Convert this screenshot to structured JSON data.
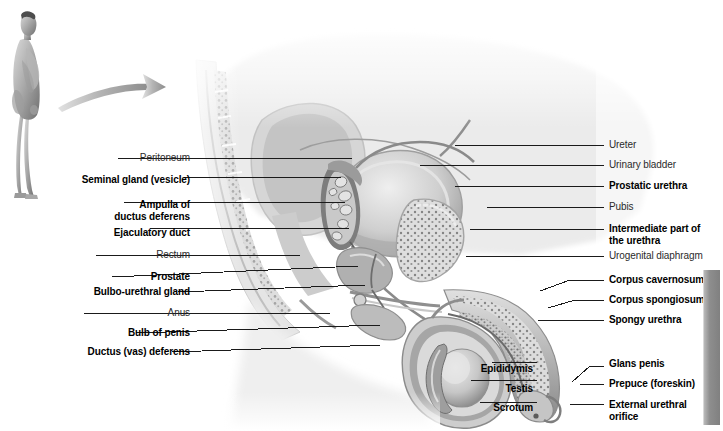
{
  "figure": {
    "orientation_figure_alt": "standing-male-body-profile",
    "arrow_alt": "curved-arrow-pointing-right",
    "background_color": "#ffffff",
    "line_color": "#1a1a1a",
    "bold_label_color": "#000000",
    "plain_label_color": "#2b2b2b",
    "accent_gray": "#808080"
  },
  "labels_left": [
    {
      "text": "Peritoneum",
      "bold": false,
      "x": 60,
      "y": 158,
      "anchor_x": 352,
      "anchor_y": 158
    },
    {
      "text": "Seminal gland (vesicle)",
      "bold": true,
      "x": 60,
      "y": 180,
      "anchor_x": 341,
      "anchor_y": 177
    },
    {
      "text": "Ampulla of\nductus deferens",
      "bold": true,
      "x": 60,
      "y": 210,
      "anchor_x": 345,
      "anchor_y": 202
    },
    {
      "text": "Ejaculatory duct",
      "bold": true,
      "x": 60,
      "y": 233,
      "anchor_x": 349,
      "anchor_y": 228
    },
    {
      "text": "Rectum",
      "bold": false,
      "x": 60,
      "y": 255,
      "anchor_x": 300,
      "anchor_y": 255
    },
    {
      "text": "Prostate",
      "bold": true,
      "x": 60,
      "y": 277,
      "anchor_x": 358,
      "anchor_y": 264
    },
    {
      "text": "Bulbo-urethral gland",
      "bold": true,
      "x": 60,
      "y": 292,
      "anchor_x": 365,
      "anchor_y": 285
    },
    {
      "text": "Anus",
      "bold": false,
      "x": 60,
      "y": 313,
      "anchor_x": 330,
      "anchor_y": 313
    },
    {
      "text": "Bulb of penis",
      "bold": true,
      "x": 60,
      "y": 333,
      "anchor_x": 380,
      "anchor_y": 325
    },
    {
      "text": "Ductus (vas) deferens",
      "bold": true,
      "x": 60,
      "y": 352,
      "anchor_x": 380,
      "anchor_y": 345
    }
  ],
  "labels_right": [
    {
      "text": "Ureter",
      "bold": false,
      "x": 609,
      "y": 145,
      "anchor_x": 455,
      "anchor_y": 145
    },
    {
      "text": "Urinary bladder",
      "bold": false,
      "x": 609,
      "y": 165,
      "anchor_x": 420,
      "anchor_y": 165
    },
    {
      "text": "Prostatic urethra",
      "bold": true,
      "x": 609,
      "y": 186,
      "anchor_x": 455,
      "anchor_y": 186
    },
    {
      "text": "Pubis",
      "bold": false,
      "x": 609,
      "y": 207,
      "anchor_x": 487,
      "anchor_y": 207
    },
    {
      "text": "Intermediate part of\nthe urethra",
      "bold": true,
      "x": 609,
      "y": 234,
      "anchor_x": 470,
      "anchor_y": 229
    },
    {
      "text": "Urogenital diaphragm",
      "bold": false,
      "x": 609,
      "y": 256,
      "anchor_x": 466,
      "anchor_y": 256
    },
    {
      "text": "Corpus cavernosum",
      "bold": true,
      "x": 609,
      "y": 280,
      "anchor_x": 540,
      "anchor_y": 291
    },
    {
      "text": "Corpus spongiosum",
      "bold": true,
      "x": 609,
      "y": 300,
      "anchor_x": 545,
      "anchor_y": 308
    },
    {
      "text": "Spongy urethra",
      "bold": true,
      "x": 609,
      "y": 320,
      "anchor_x": 540,
      "anchor_y": 320
    },
    {
      "text": "Glans penis",
      "bold": true,
      "x": 609,
      "y": 364,
      "anchor_x": 575,
      "anchor_y": 379
    },
    {
      "text": "Prepuce (foreskin)",
      "bold": true,
      "x": 609,
      "y": 384,
      "anchor_x": 579,
      "anchor_y": 384
    },
    {
      "text": "External urethral\norifice",
      "bold": true,
      "x": 609,
      "y": 410,
      "anchor_x": 573,
      "anchor_y": 404
    }
  ],
  "labels_bottom": [
    {
      "text": "Epididymis",
      "bold": true,
      "x": 434,
      "y": 363,
      "anchor_x": 513,
      "anchor_y": 362
    },
    {
      "text": "Testis",
      "bold": true,
      "x": 434,
      "y": 383,
      "anchor_x": 520,
      "anchor_y": 381
    },
    {
      "text": "Scrotum",
      "bold": true,
      "x": 434,
      "y": 402,
      "anchor_x": 505,
      "anchor_y": 402
    }
  ],
  "right_bar": {
    "x": 703,
    "y": 270,
    "width": 16,
    "height": 155
  }
}
